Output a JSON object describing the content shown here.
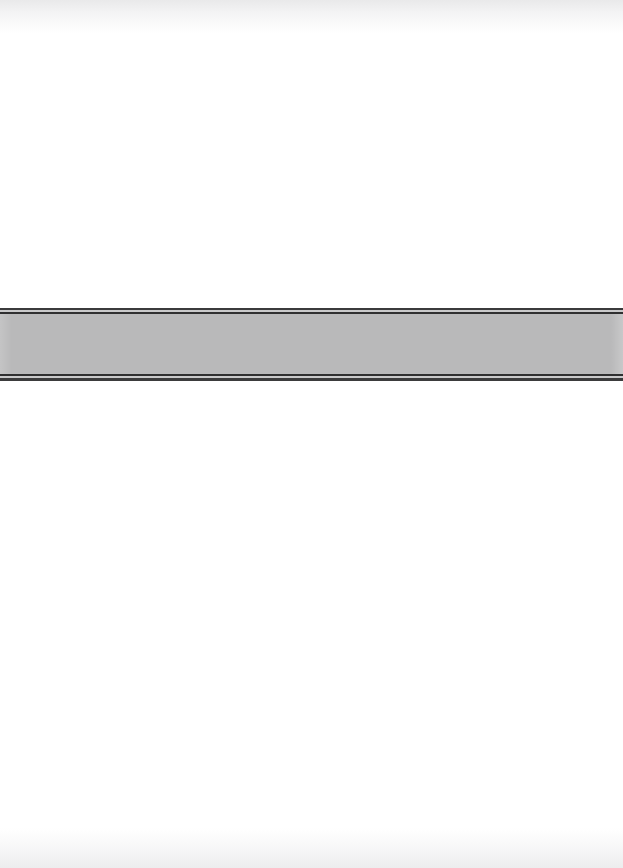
{
  "page": {
    "kind": "scanned-document-page",
    "width": 623,
    "height": 868,
    "background_color": "#ffffff",
    "text_content": "",
    "notes_label": ""
  },
  "band": {
    "label": "",
    "fill_color": "#b9b9ba",
    "rule_color": "#2f2f30",
    "rule_gap_color": "#c9c9ca",
    "top": 308,
    "height": 73,
    "caption": ""
  },
  "regions": {
    "above_label": "",
    "below_label": ""
  },
  "scan_edges": {
    "top_label": "",
    "bottom_label": ""
  }
}
